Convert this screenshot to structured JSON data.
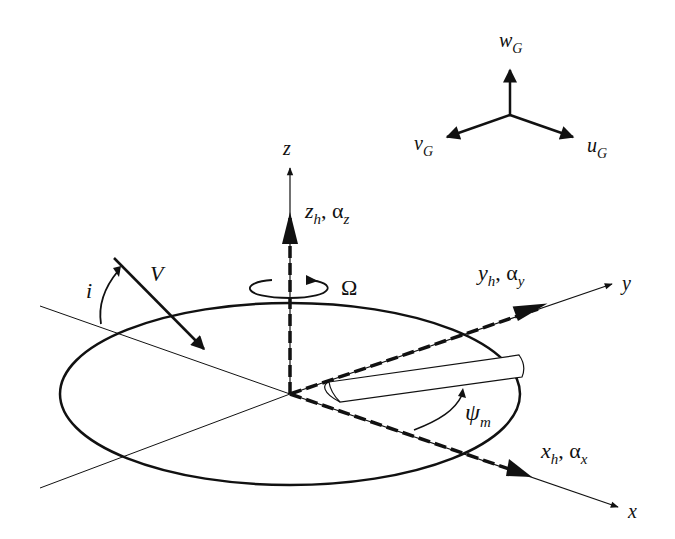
{
  "diagram": {
    "type": "rotor-coordinate-systems",
    "gust_axes": {
      "w": {
        "base": "w",
        "sub": "G"
      },
      "v": {
        "base": "v",
        "sub": "G"
      },
      "u": {
        "base": "u",
        "sub": "G"
      }
    },
    "inertial_axes": {
      "x": "x",
      "y": "y",
      "z": "z"
    },
    "hub_axes": {
      "z": {
        "base": "z",
        "sub": "h",
        "sep": ", ",
        "greek": "α",
        "greek_sub": "z"
      },
      "y": {
        "base": "y",
        "sub": "h",
        "sep": ", ",
        "greek": "α",
        "greek_sub": "y"
      },
      "x": {
        "base": "x",
        "sub": "h",
        "sep": ", ",
        "greek": "α",
        "greek_sub": "x"
      }
    },
    "rotation": "Ω",
    "velocity": "V",
    "inclination": "i",
    "azimuth": {
      "base": "ψ",
      "sub": "m"
    },
    "colors": {
      "ink": "#111111",
      "background": "#ffffff"
    }
  }
}
